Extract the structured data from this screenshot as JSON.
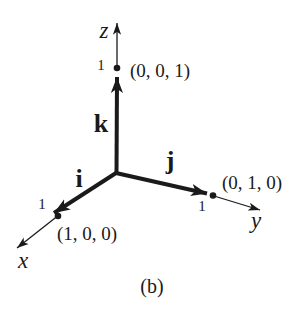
{
  "figure": {
    "caption": "(b)"
  },
  "colors": {
    "ink": "#1a1a1a",
    "background": "#ffffff"
  },
  "axes": {
    "x": {
      "label": "x",
      "tick": "1",
      "unit_point": "(1, 0, 0)"
    },
    "y": {
      "label": "y",
      "tick": "1",
      "unit_point": "(0, 1, 0)"
    },
    "z": {
      "label": "z",
      "tick": "1",
      "unit_point": "(0, 0, 1)"
    }
  },
  "vectors": {
    "i": {
      "label": "i"
    },
    "j": {
      "label": "j"
    },
    "k": {
      "label": "k"
    }
  }
}
